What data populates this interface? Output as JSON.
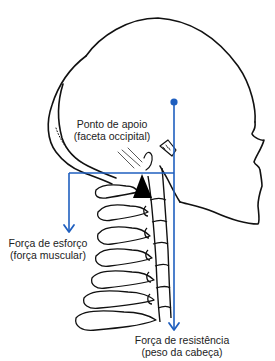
{
  "diagram": {
    "colors": {
      "force_lines": "#1f5fbf",
      "outline": "#111111",
      "fulcrum": "#000000",
      "text": "#222222",
      "background": "#ffffff"
    },
    "labels": {
      "fulcrum": {
        "line1": "Ponto de apoio",
        "line2": "(faceta occipital)"
      },
      "effort": {
        "line1": "Força de esforço",
        "line2": "(força muscular)"
      },
      "resistance": {
        "line1": "Força de resistência",
        "line2": "(peso da cabeça)"
      }
    },
    "elements": [
      {
        "name": "skull-outline",
        "type": "drawing"
      },
      {
        "name": "face-profile",
        "type": "drawing"
      },
      {
        "name": "cervical-vertebrae",
        "type": "drawing",
        "count": 7
      },
      {
        "name": "fulcrum-triangle",
        "type": "marker"
      },
      {
        "name": "effort-arrow",
        "type": "arrow",
        "direction": "down"
      },
      {
        "name": "resistance-arrow",
        "type": "arrow",
        "direction": "down"
      },
      {
        "name": "lever-bar",
        "type": "line",
        "orientation": "horizontal"
      },
      {
        "name": "center-of-mass-dot",
        "type": "marker"
      }
    ]
  }
}
